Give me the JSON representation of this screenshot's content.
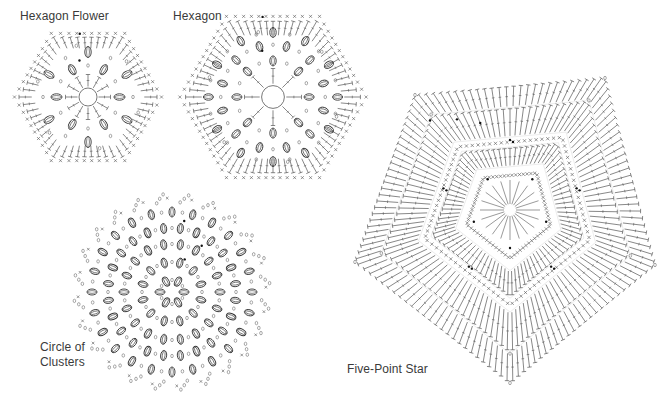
{
  "diagrams": [
    {
      "id": "hexagon-flower",
      "label": "Hexagon Flower",
      "shape": "hexagon",
      "center": [
        88,
        97
      ],
      "radius": 75,
      "rounds": 6,
      "clusters_per_ring": 6,
      "cluster_rings": 2
    },
    {
      "id": "hexagon",
      "label": "Hexagon",
      "shape": "hexagon",
      "center": [
        273,
        97
      ],
      "radius": 95,
      "rounds": 8,
      "clusters_per_ring": 12,
      "cluster_rings": 3
    },
    {
      "id": "circle-of-clusters",
      "label_line1": "Circle of",
      "label_line2": "Clusters",
      "shape": "circle",
      "center": [
        172,
        292
      ],
      "radius": 100,
      "cluster_rings": 5
    },
    {
      "id": "five-point-star",
      "label": "Five-Point Star",
      "shape": "pentagon",
      "center": [
        510,
        210
      ],
      "rounds": 10
    }
  ],
  "colors": {
    "ink": "#555555",
    "label": "#3a3a3a",
    "background": "#ffffff",
    "dot": "#111111"
  }
}
